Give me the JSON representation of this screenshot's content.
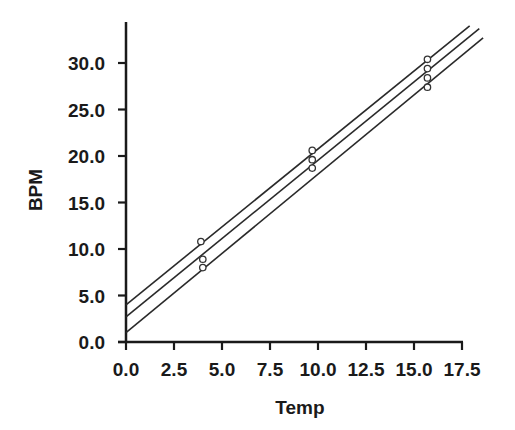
{
  "chart_data": {
    "type": "scatter",
    "title": "",
    "xlabel": "Temp",
    "ylabel": "BPM",
    "xlim": [
      0,
      17.5
    ],
    "ylim": [
      0,
      30
    ],
    "x_ticks": [
      "0.0",
      "2.5",
      "5.0",
      "7.5",
      "10.0",
      "12.5",
      "15.0",
      "17.5"
    ],
    "y_ticks": [
      "0.0",
      "5.0",
      "10.0",
      "15.0",
      "20.0",
      "25.0",
      "30.0"
    ],
    "grid": false,
    "legend": null,
    "series": [
      {
        "name": "observations",
        "kind": "scatter",
        "marker": "open-circle",
        "points": [
          {
            "x": 3.9,
            "y": 10.8
          },
          {
            "x": 4.0,
            "y": 8.9
          },
          {
            "x": 4.0,
            "y": 8.0
          },
          {
            "x": 9.7,
            "y": 20.6
          },
          {
            "x": 9.7,
            "y": 19.6
          },
          {
            "x": 9.7,
            "y": 18.7
          },
          {
            "x": 15.7,
            "y": 30.4
          },
          {
            "x": 15.7,
            "y": 29.4
          },
          {
            "x": 15.7,
            "y": 28.4
          },
          {
            "x": 15.7,
            "y": 27.4
          }
        ]
      },
      {
        "name": "upper confidence band",
        "kind": "line",
        "from": {
          "x": 0,
          "y": 4.0
        },
        "to": {
          "x": 17.9,
          "y": 34.0
        }
      },
      {
        "name": "regression fit",
        "kind": "line",
        "from": {
          "x": 0,
          "y": 2.7
        },
        "to": {
          "x": 18.4,
          "y": 33.7
        }
      },
      {
        "name": "lower confidence band",
        "kind": "line",
        "from": {
          "x": 0,
          "y": 1.0
        },
        "to": {
          "x": 18.6,
          "y": 32.7
        }
      }
    ]
  },
  "colors": {
    "axis": "#1a1a1a",
    "line": "#2a2a2a",
    "marker": "#333333",
    "background": "#ffffff"
  }
}
